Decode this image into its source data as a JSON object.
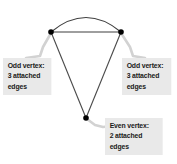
{
  "diagram": {
    "background_color": "#ffffff",
    "edge_color": "#3a3a3a",
    "vertex_color": "#000000",
    "leader_color": "#cfcfcf",
    "callout_background": "#e9e9e9",
    "callout_text_color": "#1a1a1a"
  },
  "graph": {
    "vertices": [
      {
        "id": "top-left",
        "x": 51,
        "y": 32,
        "degree": 3,
        "parity": "odd"
      },
      {
        "id": "top-right",
        "x": 121,
        "y": 32,
        "degree": 3,
        "parity": "odd"
      },
      {
        "id": "bottom",
        "x": 86,
        "y": 118,
        "degree": 2,
        "parity": "even"
      }
    ],
    "edges": [
      {
        "id": "arc-top",
        "from": "top-left",
        "to": "top-right",
        "shape": "arc",
        "apex_y": 12
      },
      {
        "id": "chord-top",
        "from": "top-left",
        "to": "top-right",
        "shape": "straight"
      },
      {
        "id": "left-side",
        "from": "top-left",
        "to": "bottom",
        "shape": "straight"
      },
      {
        "id": "right-side",
        "from": "top-right",
        "to": "bottom",
        "shape": "straight"
      }
    ]
  },
  "callouts": [
    {
      "id": "left",
      "target": "top-left",
      "lines": [
        "Odd vertex:",
        "3 attached",
        "edges"
      ]
    },
    {
      "id": "right",
      "target": "top-right",
      "lines": [
        "Odd vertex:",
        "3 attached",
        "edges"
      ]
    },
    {
      "id": "bottom",
      "target": "bottom",
      "lines": [
        "Even vertex:",
        "2 attached",
        "edges"
      ]
    }
  ]
}
